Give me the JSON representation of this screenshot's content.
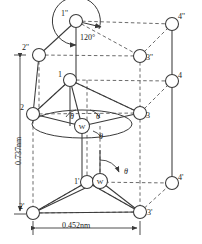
{
  "figure": {
    "stroke_color": "#3a3a3a",
    "background": "#ffffff",
    "atom_fill": "#ffffff"
  },
  "dimensions": {
    "height_label": "0.737nm",
    "width_label": "0.452nm"
  },
  "angles": {
    "top_angle": "120°",
    "theta": "θ"
  },
  "atoms": {
    "center_label": "W",
    "nodes": [
      {
        "id": "n1pp",
        "label": "1''",
        "cx": 76,
        "cy": 21,
        "r": 6.5,
        "label_dx": -15,
        "label_dy": -11
      },
      {
        "id": "n4pp",
        "label": "4''",
        "cx": 172,
        "cy": 24,
        "r": 6.5,
        "label_dx": 6,
        "label_dy": -11
      },
      {
        "id": "n2pp",
        "label": "2''",
        "cx": 39,
        "cy": 55,
        "r": 6.5,
        "label_dx": -17,
        "label_dy": -11
      },
      {
        "id": "n3pp",
        "label": "3''",
        "cx": 140,
        "cy": 56,
        "r": 6.5,
        "label_dx": 6,
        "label_dy": -2
      },
      {
        "id": "n1",
        "label": "1",
        "cx": 70,
        "cy": 80,
        "r": 6.5,
        "label_dx": -12,
        "label_dy": -9
      },
      {
        "id": "n4",
        "label": "4",
        "cx": 172,
        "cy": 81,
        "r": 6.5,
        "label_dx": 6,
        "label_dy": -9
      },
      {
        "id": "n2",
        "label": "2",
        "cx": 33,
        "cy": 114,
        "r": 6.5,
        "label_dx": -13,
        "label_dy": -10
      },
      {
        "id": "n3",
        "label": "3",
        "cx": 140,
        "cy": 113,
        "r": 6.5,
        "label_dx": 6,
        "label_dy": -1
      },
      {
        "id": "n1p",
        "label": "1'",
        "cx": 87,
        "cy": 182,
        "r": 6.5,
        "label_dx": -13,
        "label_dy": -4
      },
      {
        "id": "n4p",
        "label": "4'",
        "cx": 172,
        "cy": 183,
        "r": 6.5,
        "label_dx": 6,
        "label_dy": -9
      },
      {
        "id": "n2p",
        "label": "2'",
        "cx": 33,
        "cy": 213,
        "r": 6.5,
        "label_dx": -14,
        "label_dy": -10
      },
      {
        "id": "n3p",
        "label": "3'",
        "cx": 140,
        "cy": 212,
        "r": 6.5,
        "label_dx": 7,
        "label_dy": -3
      },
      {
        "id": "wUpper",
        "label": "W",
        "cx": 82,
        "cy": 126,
        "r": 7.5,
        "label_dx": 0,
        "label_dy": 0
      },
      {
        "id": "wLower",
        "label": "W",
        "cx": 100,
        "cy": 181,
        "r": 7.5,
        "label_dx": 0,
        "label_dy": 0
      }
    ]
  },
  "theta_marks": [
    {
      "id": "theta-upper-left",
      "x": 70,
      "y": 113
    },
    {
      "id": "theta-upper-right",
      "x": 96,
      "y": 113
    },
    {
      "id": "theta-upper-below",
      "x": 99,
      "y": 133
    },
    {
      "id": "theta-lower",
      "x": 124,
      "y": 168
    }
  ]
}
